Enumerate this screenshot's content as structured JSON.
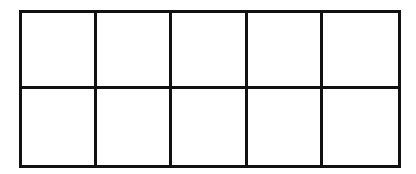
{
  "grid": {
    "rows": 2,
    "columns": 5,
    "line_color": "#111111",
    "fill_color": "#ffffff",
    "cells": [
      [
        "",
        "",
        "",
        "",
        ""
      ],
      [
        "",
        "",
        "",
        "",
        ""
      ]
    ]
  }
}
